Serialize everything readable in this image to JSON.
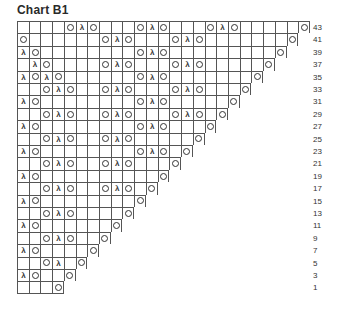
{
  "title": "Chart B1",
  "symbols": {
    "O": "yarn-over",
    "λ": "decrease"
  },
  "rows": [
    {
      "label": "43",
      "cells": 25,
      "marks": {
        "5": "O",
        "6": "λ",
        "7": "O",
        "11": "O",
        "12": "λ",
        "13": "O",
        "17": "O",
        "18": "λ",
        "19": "O",
        "25": "O"
      }
    },
    {
      "label": "41",
      "cells": 24,
      "marks": {
        "1": "O",
        "8": "O",
        "9": "λ",
        "10": "O",
        "14": "O",
        "15": "λ",
        "16": "O",
        "24": "O"
      }
    },
    {
      "label": "39",
      "cells": 23,
      "marks": {
        "1": "λ",
        "2": "O",
        "11": "O",
        "12": "λ",
        "13": "O",
        "23": "O"
      }
    },
    {
      "label": "37",
      "cells": 22,
      "marks": {
        "2": "λ",
        "3": "O",
        "8": "O",
        "9": "λ",
        "10": "O",
        "14": "O",
        "15": "λ",
        "16": "O",
        "22": "O"
      }
    },
    {
      "label": "35",
      "cells": 21,
      "marks": {
        "1": "λ",
        "2": "O",
        "3": "λ",
        "4": "O",
        "11": "O",
        "12": "λ",
        "13": "O",
        "21": "O"
      }
    },
    {
      "label": "33",
      "cells": 20,
      "marks": {
        "3": "O",
        "4": "λ",
        "5": "O",
        "8": "O",
        "9": "λ",
        "10": "O",
        "14": "O",
        "15": "λ",
        "16": "O",
        "20": "O"
      }
    },
    {
      "label": "31",
      "cells": 19,
      "marks": {
        "1": "λ",
        "2": "O",
        "11": "O",
        "12": "λ",
        "13": "O",
        "19": "O"
      }
    },
    {
      "label": "29",
      "cells": 18,
      "marks": {
        "3": "O",
        "4": "λ",
        "5": "O",
        "8": "O",
        "9": "λ",
        "10": "O",
        "14": "O",
        "15": "λ",
        "16": "O",
        "18": "O"
      }
    },
    {
      "label": "27",
      "cells": 17,
      "marks": {
        "1": "λ",
        "2": "O",
        "11": "O",
        "12": "λ",
        "13": "O",
        "17": "O"
      }
    },
    {
      "label": "25",
      "cells": 16,
      "marks": {
        "3": "O",
        "4": "λ",
        "5": "O",
        "8": "O",
        "9": "λ",
        "10": "O",
        "16": "O"
      }
    },
    {
      "label": "23",
      "cells": 15,
      "marks": {
        "1": "λ",
        "2": "O",
        "11": "O",
        "12": "λ",
        "13": "O",
        "15": "O"
      }
    },
    {
      "label": "21",
      "cells": 14,
      "marks": {
        "3": "O",
        "4": "λ",
        "5": "O",
        "8": "O",
        "9": "λ",
        "10": "O",
        "14": "O"
      }
    },
    {
      "label": "19",
      "cells": 13,
      "marks": {
        "1": "λ",
        "2": "O",
        "13": "O"
      }
    },
    {
      "label": "17",
      "cells": 12,
      "marks": {
        "3": "O",
        "4": "λ",
        "5": "O",
        "8": "O",
        "9": "λ",
        "10": "O",
        "12": "O"
      }
    },
    {
      "label": "15",
      "cells": 11,
      "marks": {
        "1": "λ",
        "2": "O",
        "11": "O"
      }
    },
    {
      "label": "13",
      "cells": 10,
      "marks": {
        "3": "O",
        "4": "λ",
        "5": "O",
        "10": "O"
      }
    },
    {
      "label": "11",
      "cells": 9,
      "marks": {
        "1": "λ",
        "2": "O",
        "9": "O"
      }
    },
    {
      "label": "9",
      "cells": 8,
      "marks": {
        "3": "O",
        "4": "λ",
        "5": "O",
        "8": "O"
      }
    },
    {
      "label": "7",
      "cells": 7,
      "marks": {
        "1": "λ",
        "2": "O",
        "7": "O"
      }
    },
    {
      "label": "5",
      "cells": 6,
      "marks": {
        "3": "O",
        "4": "λ",
        "6": "O"
      }
    },
    {
      "label": "3",
      "cells": 5,
      "marks": {
        "1": "λ",
        "2": "O",
        "5": "O"
      }
    },
    {
      "label": "1",
      "cells": 4,
      "marks": {
        "4": "O"
      }
    }
  ]
}
